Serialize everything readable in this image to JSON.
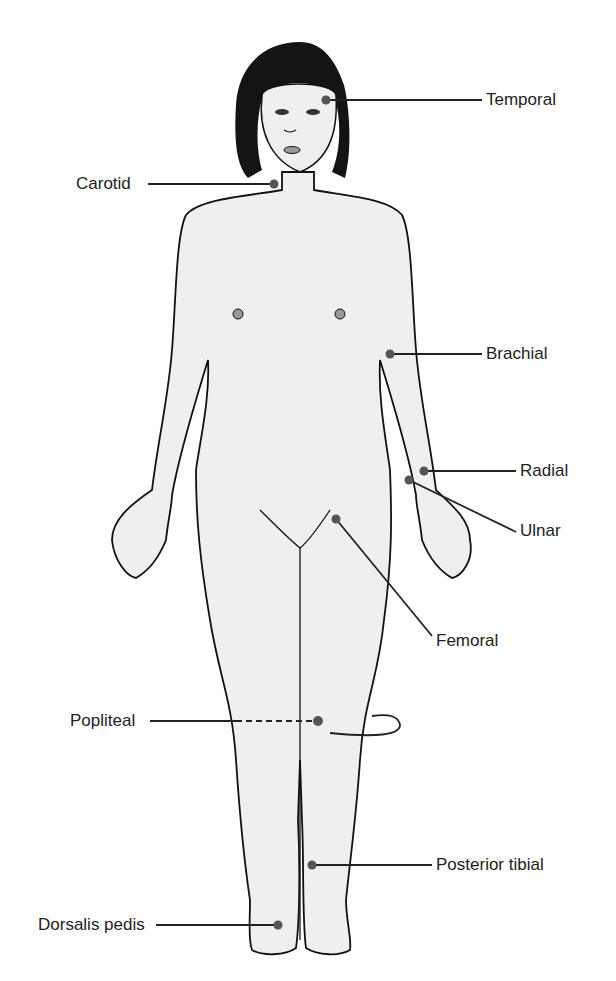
{
  "diagram": {
    "colors": {
      "skin": "#efefef",
      "outline": "#111111",
      "hair": "#141414",
      "point": "#555555",
      "line": "#222222"
    },
    "pulse_points": [
      {
        "id": "temporal",
        "label": "Temporal",
        "side": "right"
      },
      {
        "id": "carotid",
        "label": "Carotid",
        "side": "left"
      },
      {
        "id": "brachial",
        "label": "Brachial",
        "side": "right"
      },
      {
        "id": "radial",
        "label": "Radial",
        "side": "right"
      },
      {
        "id": "ulnar",
        "label": "Ulnar",
        "side": "right"
      },
      {
        "id": "femoral",
        "label": "Femoral",
        "side": "right"
      },
      {
        "id": "popliteal",
        "label": "Popliteal",
        "side": "left"
      },
      {
        "id": "posterior-tibial",
        "label": "Posterior tibial",
        "side": "right"
      },
      {
        "id": "dorsalis-pedis",
        "label": "Dorsalis pedis",
        "side": "left"
      }
    ]
  }
}
